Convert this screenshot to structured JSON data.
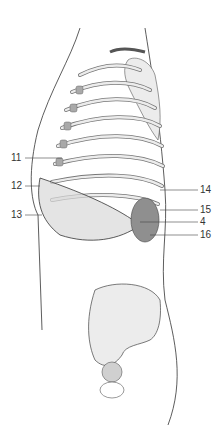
{
  "figure": {
    "type": "anatomical-illustration",
    "labels": [
      {
        "id": "11",
        "text": "11",
        "side": "left"
      },
      {
        "id": "12",
        "text": "12",
        "side": "left"
      },
      {
        "id": "13",
        "text": "13",
        "side": "left"
      },
      {
        "id": "14",
        "text": "14",
        "side": "right"
      },
      {
        "id": "15",
        "text": "15",
        "side": "right"
      },
      {
        "id": "4",
        "text": "4",
        "side": "right"
      },
      {
        "id": "16",
        "text": "16",
        "side": "right"
      }
    ],
    "colors": {
      "outline": "#333333",
      "bone": "#e9e9e9",
      "bone_shade": "#bdbdbd",
      "organ": "#8f8f8f",
      "leader": "#444444"
    }
  }
}
